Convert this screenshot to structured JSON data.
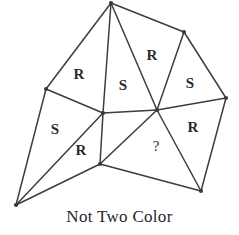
{
  "figure": {
    "caption": "Not Two Color",
    "line_color": "#3c3c42",
    "label_color": "#2b2b2b",
    "background_color": "#ffffff",
    "vertices": [
      {
        "name": "apex",
        "x": 111,
        "y": 3
      },
      {
        "name": "top-right",
        "x": 184,
        "y": 32
      },
      {
        "name": "left",
        "x": 46,
        "y": 89
      },
      {
        "name": "right",
        "x": 226,
        "y": 98
      },
      {
        "name": "center-left",
        "x": 103,
        "y": 113
      },
      {
        "name": "center-right",
        "x": 157,
        "y": 110
      },
      {
        "name": "bottom-mid",
        "x": 100,
        "y": 164
      },
      {
        "name": "bottom-right",
        "x": 201,
        "y": 191
      },
      {
        "name": "bottom-left",
        "x": 16,
        "y": 205
      }
    ],
    "edges": [
      {
        "from": "apex",
        "to": "left"
      },
      {
        "from": "apex",
        "to": "center-left"
      },
      {
        "from": "apex",
        "to": "center-right"
      },
      {
        "from": "apex",
        "to": "top-right"
      },
      {
        "from": "top-right",
        "to": "center-right"
      },
      {
        "from": "top-right",
        "to": "right"
      },
      {
        "from": "right",
        "to": "center-right"
      },
      {
        "from": "right",
        "to": "bottom-right"
      },
      {
        "from": "left",
        "to": "center-left"
      },
      {
        "from": "left",
        "to": "bottom-left"
      },
      {
        "from": "center-left",
        "to": "center-right"
      },
      {
        "from": "center-left",
        "to": "bottom-mid"
      },
      {
        "from": "center-left",
        "to": "bottom-left"
      },
      {
        "from": "center-right",
        "to": "bottom-mid"
      },
      {
        "from": "center-right",
        "to": "bottom-right"
      },
      {
        "from": "bottom-mid",
        "to": "bottom-left"
      },
      {
        "from": "bottom-mid",
        "to": "bottom-right"
      }
    ],
    "region_labels": [
      {
        "id": "region-upper-left",
        "text": "R",
        "x": 79,
        "y": 74
      },
      {
        "id": "region-center-upper",
        "text": "S",
        "x": 123,
        "y": 85
      },
      {
        "id": "region-upper-right",
        "text": "R",
        "x": 152,
        "y": 55
      },
      {
        "id": "region-right-upper",
        "text": "S",
        "x": 190,
        "y": 83
      },
      {
        "id": "region-right-lower",
        "text": "R",
        "x": 193,
        "y": 127
      },
      {
        "id": "region-left-lower",
        "text": "S",
        "x": 55,
        "y": 129
      },
      {
        "id": "region-center-lower",
        "text": "R",
        "x": 81,
        "y": 150
      },
      {
        "id": "region-unknown",
        "text": "?",
        "x": 156,
        "y": 146
      }
    ]
  }
}
